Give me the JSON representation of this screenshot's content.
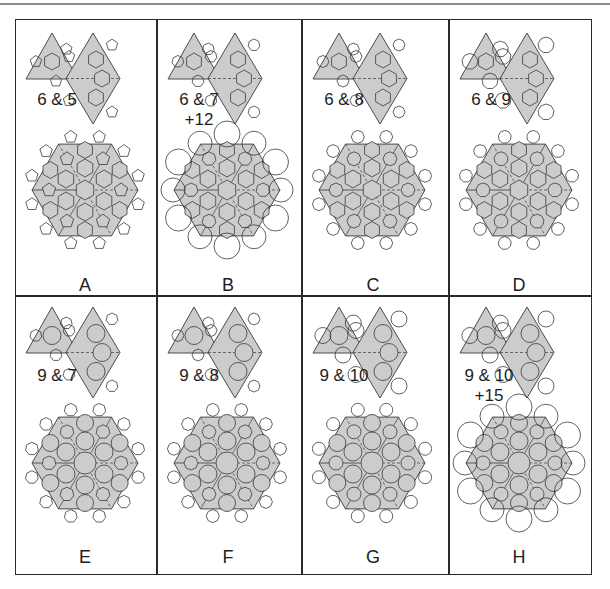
{
  "figure": {
    "colors": {
      "fill": "#cccccc",
      "stroke": "#3a3a3a",
      "outline_fill": "#ffffff",
      "frame": "#2a2a2a"
    },
    "panels": [
      {
        "id": "A",
        "letter": "A",
        "pair": "6 & 5",
        "extra": "",
        "large": 6,
        "small": 5,
        "style": "poly"
      },
      {
        "id": "B",
        "letter": "B",
        "pair": "6 & 7",
        "extra": "+12",
        "large": 6,
        "small": 7,
        "style": "poly",
        "outer": 12
      },
      {
        "id": "C",
        "letter": "C",
        "pair": "6 & 8",
        "extra": "",
        "large": 6,
        "small": 8,
        "style": "poly"
      },
      {
        "id": "D",
        "letter": "D",
        "pair": "6 & 9",
        "extra": "",
        "large": 6,
        "small": 9,
        "style": "poly"
      },
      {
        "id": "E",
        "letter": "E",
        "pair": "9 & 7",
        "extra": "",
        "large": 9,
        "small": 7,
        "style": "circle"
      },
      {
        "id": "F",
        "letter": "F",
        "pair": "9 & 8",
        "extra": "",
        "large": 9,
        "small": 8,
        "style": "circle"
      },
      {
        "id": "G",
        "letter": "G",
        "pair": "9 & 10",
        "extra": "",
        "large": 9,
        "small": 10,
        "style": "circle"
      },
      {
        "id": "H",
        "letter": "H",
        "pair": "9 & 10",
        "extra": "+15",
        "large": 9,
        "small": 10,
        "style": "circle",
        "outer": 15
      }
    ]
  }
}
